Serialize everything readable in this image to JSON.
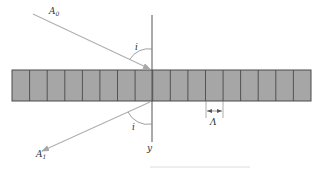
{
  "diagram": {
    "labels": {
      "incident_ray": "A",
      "incident_ray_sub": "0",
      "reflected_ray": "A",
      "reflected_ray_sub": "1",
      "angle_top": "i",
      "angle_bottom": "i",
      "axis": "y",
      "period": "Λ"
    },
    "grating": {
      "cell_count": 17,
      "fill_color": "#a6a6a6",
      "border_color": "#4a4a4a"
    },
    "colors": {
      "ray": "#b0b0b0",
      "axis": "#555555",
      "text": "#333333"
    }
  }
}
